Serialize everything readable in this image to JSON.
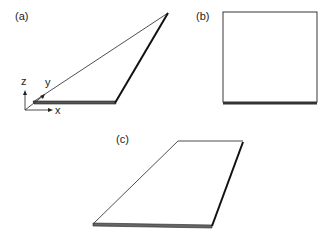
{
  "panels": {
    "a": {
      "label": "(a)",
      "axes": {
        "x": "x",
        "y": "y",
        "z": "z"
      }
    },
    "b": {
      "label": "(b)"
    },
    "c": {
      "label": "(c)"
    }
  },
  "colors": {
    "line": "#1a1a1a",
    "background": "#ffffff"
  }
}
